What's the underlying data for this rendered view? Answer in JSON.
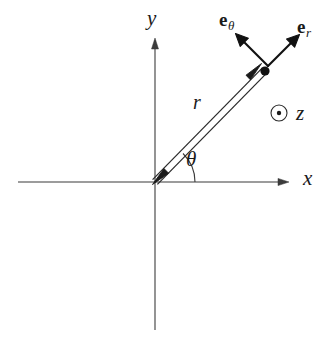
{
  "figure": {
    "background_color": "#ffffff",
    "stroke_color": "#1a1a1a",
    "axis_color": "#3a3a3a",
    "width": 335,
    "height": 341
  },
  "axes": {
    "x_label": "x",
    "y_label": "y",
    "origin": {
      "x": 155,
      "y": 182
    },
    "x_axis": {
      "x1": 18,
      "y1": 182,
      "x2": 288,
      "y2": 182,
      "arrow": "right"
    },
    "y_axis": {
      "x1": 155,
      "y1": 330,
      "x2": 155,
      "y2": 38,
      "arrow": "up"
    }
  },
  "vectors": {
    "r": {
      "label": "r",
      "style": "double-line-double-headed",
      "from": {
        "x": 155,
        "y": 182
      },
      "to": {
        "x": 265,
        "y": 70
      }
    },
    "e_theta": {
      "base": "e",
      "subscript": "θ",
      "from": {
        "x": 268,
        "y": 66
      },
      "to": {
        "x": 237,
        "y": 35
      }
    },
    "e_r": {
      "base": "e",
      "subscript": "r",
      "from": {
        "x": 268,
        "y": 66
      },
      "to": {
        "x": 298,
        "y": 36
      }
    }
  },
  "angle": {
    "label": "θ",
    "arc_radius": 40,
    "start_deg": 0,
    "end_deg": 45.5
  },
  "point": {
    "name": "position-point",
    "x": 265,
    "y": 71,
    "radius": 4.6
  },
  "z_axis_out_of_page": {
    "symbol": "⊙",
    "label": "z",
    "circle": {
      "cx": 279,
      "cy": 113,
      "r": 8
    },
    "dot_radius": 2.2
  }
}
